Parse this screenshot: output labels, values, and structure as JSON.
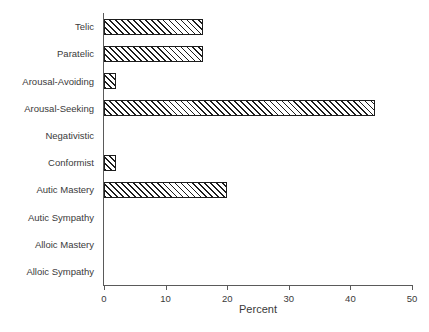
{
  "chart_data": {
    "type": "bar",
    "orientation": "horizontal",
    "title": "",
    "xlabel": "Percent",
    "ylabel": "",
    "categories": [
      "Telic",
      "Paratelic",
      "Arousal-Avoiding",
      "Arousal-Seeking",
      "Negativistic",
      "Conformist",
      "Autic Mastery",
      "Autic Sympathy",
      "Alloic Mastery",
      "Alloic Sympathy"
    ],
    "values": [
      16,
      16,
      2,
      44,
      0,
      2,
      20,
      0,
      0,
      0
    ],
    "xlim": [
      0,
      50
    ],
    "xticks": [
      0,
      10,
      20,
      30,
      40,
      50
    ],
    "xtick_labels": [
      "0",
      "10",
      "20",
      "30",
      "40",
      "50"
    ],
    "grid": false,
    "legend": null,
    "bar_fill": "#ffffff",
    "bar_hatch": "forward-diagonal",
    "bar_edge_color": "#1d1d1d",
    "axis_color": "#5a5a5a",
    "background": "#ffffff"
  }
}
